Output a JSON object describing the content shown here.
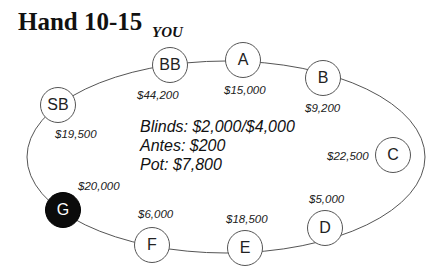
{
  "title": "Hand 10-15",
  "hero_label": "YOU",
  "info": {
    "blinds": "Blinds: $2,000/$4,000",
    "antes": "Antes: $200",
    "pot": "Pot: $7,800"
  },
  "seats": [
    {
      "id": "BB",
      "label": "BB",
      "stack": "$44,200",
      "hero": true
    },
    {
      "id": "A",
      "label": "A",
      "stack": "$15,000"
    },
    {
      "id": "B",
      "label": "B",
      "stack": "$9,200"
    },
    {
      "id": "C",
      "label": "C",
      "stack": "$22,500"
    },
    {
      "id": "D",
      "label": "D",
      "stack": "$5,000"
    },
    {
      "id": "E",
      "label": "E",
      "stack": "$18,500"
    },
    {
      "id": "F",
      "label": "F",
      "stack": "$6,000"
    },
    {
      "id": "G",
      "label": "G",
      "stack": "$20,000",
      "highlighted": true
    },
    {
      "id": "SB",
      "label": "SB",
      "stack": "$19,500"
    }
  ],
  "colors": {
    "table_line": "#555555",
    "highlight_seat": "#0b0b0b"
  }
}
